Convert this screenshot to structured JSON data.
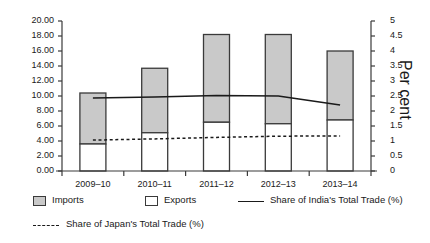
{
  "chart_data": {
    "type": "bar",
    "title": "",
    "subtitle": "",
    "xlabel": "",
    "ylabel": "US$ billions",
    "y2label": "Per cent",
    "ylim": [
      0,
      20
    ],
    "y2lim": [
      0,
      5
    ],
    "grid": false,
    "legend_position": "bottom",
    "categories": [
      "2009–10",
      "2010–11",
      "2011–12",
      "2012–13",
      "2013–14"
    ],
    "yticks": [
      "0.00",
      "2.00",
      "4.00",
      "6.00",
      "8.00",
      "10.00",
      "12.00",
      "14.00",
      "16.00",
      "18.00",
      "20.00"
    ],
    "y2ticks": [
      "0",
      "0.5",
      "1",
      "1.5",
      "2",
      "2.5",
      "3",
      "3.5",
      "4",
      "4.5",
      "5"
    ],
    "series": [
      {
        "name": "Exports",
        "kind": "bar-segment",
        "axis": "left",
        "color": "#ffffff",
        "values": [
          3.6,
          5.1,
          6.5,
          6.3,
          6.8
        ]
      },
      {
        "name": "Imports",
        "kind": "bar-segment",
        "axis": "left",
        "color": "#c9c9c9",
        "values": [
          6.8,
          8.6,
          11.7,
          11.9,
          9.2
        ]
      },
      {
        "name": "Total trade",
        "kind": "bar-total",
        "axis": "left",
        "values": [
          10.4,
          13.7,
          18.2,
          18.2,
          16.0
        ]
      },
      {
        "name": "Share of India's Total Trade (%)",
        "kind": "line",
        "axis": "right",
        "style": "solid",
        "values": [
          2.43,
          2.47,
          2.52,
          2.5,
          2.2
        ]
      },
      {
        "name": "Share of Japan's Total Trade (%)",
        "kind": "line",
        "axis": "right",
        "style": "dashed",
        "values": [
          1.03,
          1.07,
          1.12,
          1.16,
          1.17
        ]
      }
    ]
  },
  "legend": {
    "imports_label": "Imports",
    "exports_label": "Exports",
    "india_share_label": "Share of India's Total Trade (%)",
    "japan_share_label": "Share of Japan's Total Trade (%)"
  },
  "axes": {
    "left_title": "US$ billions",
    "right_title": "Per cent"
  }
}
